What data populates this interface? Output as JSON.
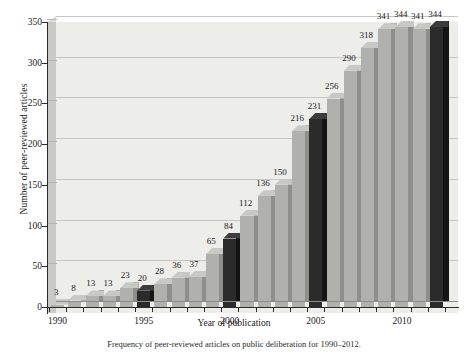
{
  "figure": {
    "caption": "Frequency of peer-reviewed articles on public deliberation for 1990–2012."
  },
  "chart_data": {
    "type": "bar",
    "title": "",
    "xlabel": "Year of publication",
    "ylabel": "Number of peer-reviewed articles",
    "categories": [
      "1990",
      "1991",
      "1992",
      "1993",
      "1994",
      "1995",
      "1996",
      "1997",
      "1998",
      "1999",
      "2000",
      "2001",
      "2002",
      "2003",
      "2004",
      "2005",
      "2006",
      "2007",
      "2008",
      "2009",
      "2010",
      "2011",
      "2012"
    ],
    "values": [
      3,
      8,
      13,
      13,
      23,
      20,
      28,
      36,
      37,
      65,
      84,
      112,
      136,
      150,
      216,
      231,
      256,
      290,
      318,
      341,
      344,
      341,
      344
    ],
    "bar_styles": [
      "light",
      "light",
      "light",
      "light",
      "light",
      "dark",
      "light",
      "light",
      "light",
      "light",
      "dark",
      "light",
      "light",
      "light",
      "light",
      "dark",
      "light",
      "light",
      "light",
      "light",
      "light",
      "light",
      "dark"
    ],
    "data_labels": [
      "3",
      "8",
      "13",
      "13",
      "23",
      "20",
      "28",
      "36",
      "37",
      "65",
      "84",
      "112",
      "136",
      "150",
      "216",
      "231",
      "256",
      "290",
      "318",
      "341",
      "344",
      "341",
      "344"
    ],
    "ylim": [
      0,
      350
    ],
    "yticks": [
      0,
      50,
      100,
      150,
      200,
      250,
      300,
      350
    ],
    "ytick_labels": [
      "0",
      "50",
      "100",
      "150",
      "200",
      "250",
      "300",
      "350"
    ],
    "xtick_labels": [
      "1990",
      "1995",
      "2000",
      "2005",
      "2010"
    ],
    "xtick_years": [
      1990,
      1995,
      2000,
      2005,
      2010
    ],
    "grid": true,
    "legend": "none",
    "colors": {
      "bar_light": "#b0b0ad",
      "bar_light_side": "#8e8e8b",
      "bar_dark": "#2b2b2b",
      "bar_dark_side": "#141414",
      "plot_background": "#ededea",
      "gridline": "#c6c6c2",
      "axis": "#2a2a2a",
      "text": "#1a1a1a"
    }
  }
}
